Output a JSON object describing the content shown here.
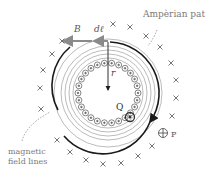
{
  "labels": {
    "amperian_path": "Ampèrian path",
    "magnetic_field_lines": "magnetic",
    "magnetic_field_lines_2": "field lines",
    "B": "B",
    "dl": "dℓ",
    "r": "r",
    "Q": "Q",
    "P": "P"
  },
  "colors": {
    "field_line": "#9a9a9a",
    "amperian": "#1a1a1a",
    "wire": "#555555",
    "x_mark": "#666666",
    "label": "#7a7a7a"
  }
}
